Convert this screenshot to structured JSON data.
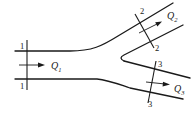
{
  "diagram": {
    "type": "pipe-junction-flow",
    "sections": [
      {
        "id": "1-1",
        "top_label": "1",
        "bottom_label": "1"
      },
      {
        "id": "2-2",
        "top_label": "2",
        "bottom_label": "2"
      },
      {
        "id": "3-3",
        "top_label": "3",
        "bottom_label": "3"
      }
    ],
    "flows": [
      {
        "symbol": "Q",
        "subscript": "1",
        "location": "main-pipe"
      },
      {
        "symbol": "Q",
        "subscript": "2",
        "location": "upper-branch"
      },
      {
        "symbol": "Q",
        "subscript": "3",
        "location": "lower-branch"
      }
    ],
    "colors": {
      "line": "#1a1a1a",
      "background": "#ffffff"
    }
  }
}
